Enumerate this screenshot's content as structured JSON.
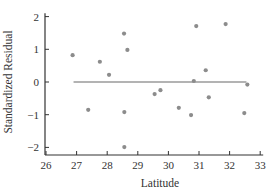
{
  "chart_data": {
    "type": "scatter",
    "title": "",
    "xlabel": "Latitude",
    "ylabel": "Standardized Residual",
    "xlim": [
      26,
      33
    ],
    "ylim": [
      -2.2,
      2.1
    ],
    "x_ticks": [
      26,
      27,
      28,
      29,
      30,
      31,
      32,
      33
    ],
    "y_ticks": [
      -2,
      -1,
      0,
      1,
      2
    ],
    "grid": false,
    "legend": null,
    "colors": {
      "points": "#8c8c8c",
      "reference_line": "#9a9a9a",
      "axes": "#333333"
    },
    "reference_line": {
      "y": 0,
      "x_start": 26.9,
      "x_end": 32.55
    },
    "series": [
      {
        "name": "Standardized Residuals",
        "points": [
          {
            "x": 26.87,
            "y": 0.82
          },
          {
            "x": 27.38,
            "y": -0.85
          },
          {
            "x": 27.76,
            "y": 0.62
          },
          {
            "x": 28.06,
            "y": 0.22
          },
          {
            "x": 28.55,
            "y": 1.48
          },
          {
            "x": 28.66,
            "y": 0.98
          },
          {
            "x": 28.56,
            "y": -0.92
          },
          {
            "x": 28.56,
            "y": -1.99
          },
          {
            "x": 29.55,
            "y": -0.37
          },
          {
            "x": 29.74,
            "y": -0.25
          },
          {
            "x": 30.34,
            "y": -0.79
          },
          {
            "x": 30.74,
            "y": -1.01
          },
          {
            "x": 30.83,
            "y": 0.03
          },
          {
            "x": 30.91,
            "y": 1.71
          },
          {
            "x": 31.22,
            "y": 0.36
          },
          {
            "x": 31.32,
            "y": -0.47
          },
          {
            "x": 31.87,
            "y": 1.77
          },
          {
            "x": 32.48,
            "y": -0.95
          },
          {
            "x": 32.58,
            "y": -0.08
          }
        ]
      }
    ]
  }
}
